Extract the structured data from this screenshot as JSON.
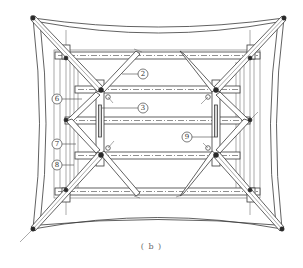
{
  "figure": {
    "caption": "( b )",
    "line_color": "#3a3a3a",
    "background": "#ffffff"
  },
  "callouts": [
    {
      "id": "2",
      "label": "2"
    },
    {
      "id": "3",
      "label": "3"
    },
    {
      "id": "6",
      "label": "6"
    },
    {
      "id": "7",
      "label": "7"
    },
    {
      "id": "8",
      "label": "8"
    },
    {
      "id": "9",
      "label": "9"
    }
  ]
}
